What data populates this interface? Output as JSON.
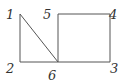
{
  "diagram": {
    "nodes": [
      {
        "id": "1",
        "label": "1",
        "x": 20,
        "y": 14,
        "lx": 6,
        "ly": 19
      },
      {
        "id": "2",
        "label": "2",
        "x": 20,
        "y": 62,
        "lx": 6,
        "ly": 73
      },
      {
        "id": "3",
        "label": "3",
        "x": 110,
        "y": 62,
        "lx": 110,
        "ly": 73
      },
      {
        "id": "4",
        "label": "4",
        "x": 110,
        "y": 14,
        "lx": 109,
        "ly": 19
      },
      {
        "id": "5",
        "label": "5",
        "x": 58,
        "y": 14,
        "lx": 43,
        "ly": 19
      },
      {
        "id": "6",
        "label": "6",
        "x": 58,
        "y": 62,
        "lx": 48,
        "ly": 80
      }
    ],
    "edges": [
      [
        "1",
        "2"
      ],
      [
        "2",
        "6"
      ],
      [
        "1",
        "6"
      ],
      [
        "5",
        "4"
      ],
      [
        "4",
        "3"
      ],
      [
        "3",
        "6"
      ],
      [
        "6",
        "5"
      ]
    ],
    "stroke_color": "#555555",
    "label_color": "#333333"
  }
}
